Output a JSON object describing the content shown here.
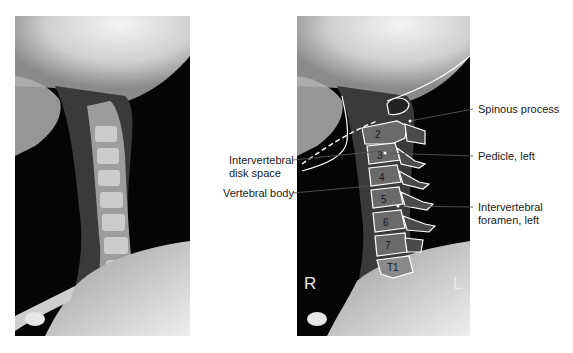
{
  "figure": {
    "left_image": {
      "description": "lateral cervical spine radiograph, unlabeled"
    },
    "right_image": {
      "description": "same radiograph with traced outlines",
      "vertebra_labels": [
        "2",
        "3",
        "4",
        "5",
        "6",
        "7",
        "T1"
      ],
      "corner_markers": {
        "right": "R",
        "left": "L"
      }
    },
    "labels_left": [
      {
        "text_line1": "Intervertebral",
        "text_line2": "disk space"
      },
      {
        "text_line1": "Vertebral body"
      }
    ],
    "labels_right": [
      {
        "text_line1": "Spinous process"
      },
      {
        "text_line1": "Pedicle, left"
      },
      {
        "text_line1": "Intervertebral",
        "text_line2": "foramen, left"
      }
    ]
  }
}
